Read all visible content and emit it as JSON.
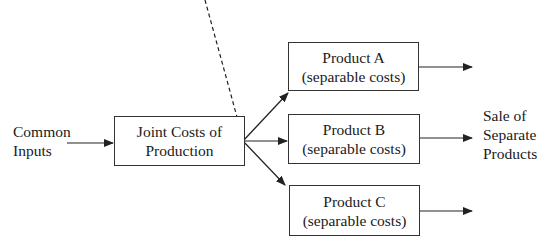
{
  "diagram": {
    "inputs_label": {
      "line1": "Common",
      "line2": "Inputs"
    },
    "joint_box": {
      "line1": "Joint Costs of",
      "line2": "Production"
    },
    "products": [
      {
        "line1": "Product A",
        "line2": "(separable costs)"
      },
      {
        "line1": "Product B",
        "line2": "(separable costs)"
      },
      {
        "line1": "Product C",
        "line2": "(separable costs)"
      }
    ],
    "output_label": {
      "line1": "Sale of",
      "line2": "Separate",
      "line3": "Products"
    },
    "colors": {
      "stroke": "#333333",
      "text": "#1a1a1a",
      "background": "#ffffff"
    }
  }
}
